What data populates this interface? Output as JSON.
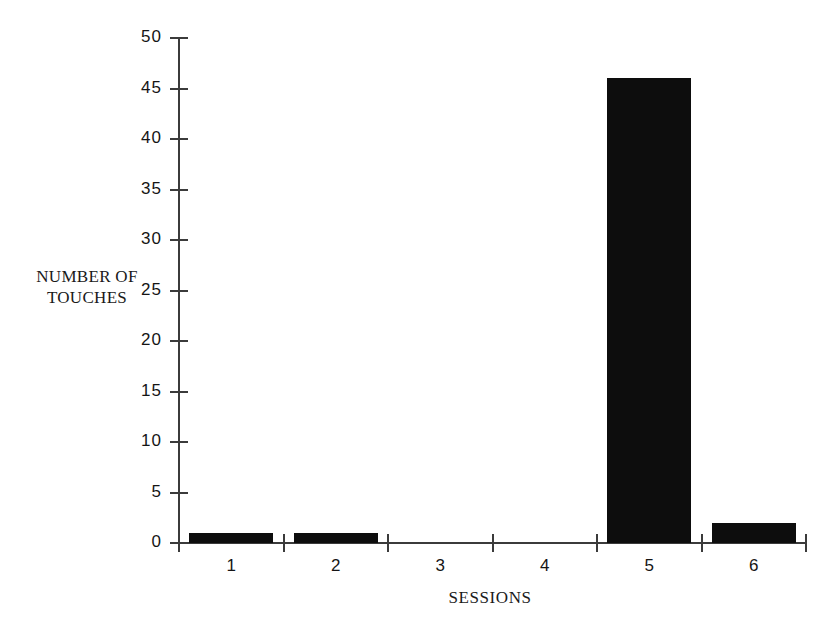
{
  "chart_data": {
    "type": "bar",
    "title": "",
    "subtitle": "",
    "xlabel": "SESSIONS",
    "ylabel": "NUMBER OF\nTOUCHES",
    "categories": [
      "1",
      "2",
      "3",
      "4",
      "5",
      "6"
    ],
    "values": [
      1,
      1,
      0,
      0,
      46,
      2
    ],
    "series": [
      {
        "name": "Number of touches",
        "values": [
          1,
          1,
          0,
          0,
          46,
          2
        ]
      }
    ],
    "ylim": [
      0,
      50
    ],
    "xlim_categories": 6,
    "y_ticks": [
      0,
      5,
      10,
      15,
      20,
      25,
      30,
      35,
      40,
      45,
      50
    ],
    "y_tick_labels": [
      "0",
      "5",
      "10",
      "15",
      "20",
      "25",
      "30",
      "35",
      "40",
      "45",
      "50"
    ],
    "x_tick_labels": [
      "1",
      "2",
      "3",
      "4",
      "5",
      "6"
    ],
    "grid": false,
    "legend": false,
    "legend_position": "none",
    "bar_color": "#0d0d0d",
    "axis_color": "#3b3b3b",
    "background_color": "#ffffff"
  },
  "axis_titles": {
    "y": "NUMBER OF\nTOUCHES",
    "x": "SESSIONS"
  }
}
